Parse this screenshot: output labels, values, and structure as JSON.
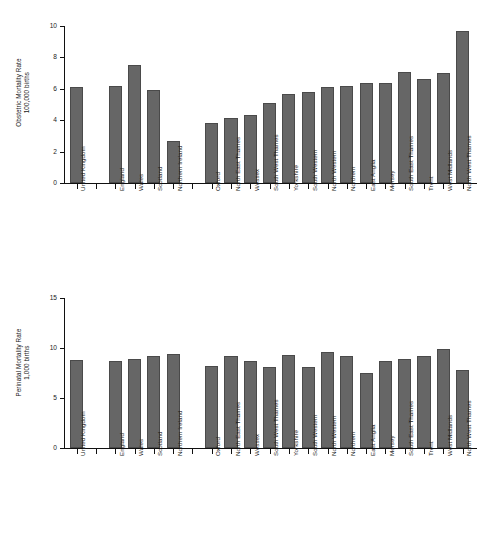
{
  "figure": {
    "background_color": "#ffffff",
    "bar_color": "#666666",
    "axis_color": "#111111",
    "panel_count": 2
  },
  "chart_data": [
    {
      "type": "bar",
      "title": "",
      "xlabel": "",
      "ylabel": "Obstetric Mortality Rate 100,000 births",
      "ylabel_line1": "Obstetric Mortality Rate",
      "ylabel_line2": "100,000 births",
      "ylim": [
        0,
        10
      ],
      "yticks": [
        0,
        2,
        4,
        6,
        8,
        10
      ],
      "ytick_labels": [
        "0",
        "2",
        "4",
        "6",
        "8",
        "10"
      ],
      "grid": false,
      "legend": "none",
      "categories": [
        "United Kingdom",
        "England",
        "Wales",
        "Scotland",
        "Northern Ireland",
        "Oxford",
        "North East Thames",
        "Wessex",
        "South West Thames",
        "Yorkshire",
        "South Western",
        "North Western",
        "Northern",
        "East Anglia",
        "Mersey",
        "South East Thames",
        "Trent",
        "West Midlands",
        "North West Thames"
      ],
      "values": [
        6.1,
        6.15,
        7.5,
        5.9,
        2.65,
        3.8,
        4.15,
        4.35,
        5.1,
        5.65,
        5.8,
        6.1,
        6.2,
        6.4,
        6.4,
        7.05,
        6.65,
        7.0,
        9.7
      ],
      "group_breaks_after": [
        0,
        4
      ]
    },
    {
      "type": "bar",
      "title": "",
      "xlabel": "",
      "ylabel": "Perinatal Mortality Rate 1,000 births",
      "ylabel_line1": "Perinatal Mortality Rate",
      "ylabel_line2": "1,000 births",
      "ylim": [
        0,
        15
      ],
      "yticks": [
        0,
        5,
        10,
        15
      ],
      "ytick_labels": [
        "0",
        "5",
        "10",
        "15"
      ],
      "grid": false,
      "legend": "none",
      "categories": [
        "United Kingdom",
        "England",
        "Wales",
        "Scotland",
        "Northern Ireland",
        "Oxford",
        "North East Thames",
        "Wessex",
        "South West Thames",
        "Yorkshire",
        "South Western",
        "North Western",
        "Northern",
        "East Anglia",
        "Mersey",
        "South East Thames",
        "Trent",
        "West Midlands",
        "North West Thames"
      ],
      "values": [
        8.8,
        8.75,
        8.95,
        9.2,
        9.4,
        8.2,
        9.2,
        8.75,
        8.1,
        9.35,
        8.1,
        9.6,
        9.2,
        7.55,
        8.7,
        8.9,
        9.2,
        9.95,
        7.8
      ],
      "group_breaks_after": [
        0,
        4
      ]
    }
  ]
}
